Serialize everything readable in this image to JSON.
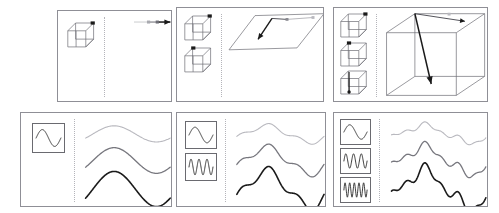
{
  "figure": {
    "background": "#ffffff",
    "width": 499,
    "height": 213,
    "panel_border_color": "#8f8f96",
    "divider_color": "#b4b4ba",
    "stroke_colors": [
      "#b9b9bf",
      "#77777e",
      "#1a1a1a"
    ],
    "rows": 2,
    "columns": 3
  },
  "panels": [
    {
      "id": "panel-1",
      "name": "one-cube-line",
      "row": 1,
      "column": 1,
      "left": 57,
      "top": 10,
      "width": 115,
      "height": 92,
      "left_label": "1 cube thumbnail",
      "right_label": "1D line with gradient arrow",
      "thumbnails": [
        {
          "kind": "cube",
          "marker": "top-right-dot",
          "left": 8,
          "top": 12,
          "width": 30,
          "height": 26
        }
      ],
      "divider_x": 46,
      "content_kind": "line-arrow",
      "arrow": {
        "description": "horizontal arrow, light-to-dark gradient, with waypoint dots",
        "waypoints": 3,
        "head": "right"
      }
    },
    {
      "id": "panel-2",
      "name": "two-cubes-plane",
      "row": 1,
      "column": 2,
      "left": 176,
      "top": 7,
      "width": 148,
      "height": 95,
      "left_label": "2 cube thumbnails",
      "right_label": "2D plane with polyline path",
      "thumbnails": [
        {
          "kind": "cube",
          "marker": "top-right-dot",
          "left": 6,
          "top": 8,
          "width": 30,
          "height": 26
        },
        {
          "kind": "cube",
          "marker": "top-left-dot",
          "left": 6,
          "top": 40,
          "width": 30,
          "height": 26
        }
      ],
      "divider_x": 44,
      "content_kind": "plane-path",
      "path": {
        "description": "parallelogram plane with kinked arrow path ending down-left",
        "vertices": 3,
        "head": "down-left"
      }
    },
    {
      "id": "panel-3",
      "name": "three-cubes-box",
      "row": 1,
      "column": 3,
      "left": 333,
      "top": 7,
      "width": 155,
      "height": 95,
      "left_label": "3 cube thumbnails",
      "right_label": "3D box with two arrows",
      "thumbnails": [
        {
          "kind": "cube",
          "marker": "top-right-dot",
          "left": 5,
          "top": 6,
          "width": 30,
          "height": 25
        },
        {
          "kind": "cube",
          "marker": "top-left-dot",
          "left": 5,
          "top": 35,
          "width": 30,
          "height": 25
        },
        {
          "kind": "cube",
          "marker": "vertical-line-dot",
          "left": 5,
          "top": 63,
          "width": 30,
          "height": 25
        }
      ],
      "divider_x": 42,
      "content_kind": "box-arrows",
      "arrows": [
        {
          "description": "short arrow to upper right",
          "head": "right"
        },
        {
          "description": "long arrow down into box interior",
          "head": "down"
        }
      ]
    },
    {
      "id": "panel-4",
      "name": "one-basis-curves",
      "row": 2,
      "column": 1,
      "left": 20,
      "top": 112,
      "width": 152,
      "height": 95,
      "left_label": "1 sine basis thumbnail",
      "right_label": "3 smooth curves of increasing amplitude",
      "thumbnails": [
        {
          "kind": "sine",
          "cycles": 1,
          "left": 11,
          "top": 10,
          "width": 33,
          "height": 30
        }
      ],
      "divider_x": 53,
      "content_kind": "curves",
      "curves": [
        {
          "index": 0,
          "cycles": 1,
          "amplitude": 0.3,
          "color": "#b9b9bf",
          "width": 1.1
        },
        {
          "index": 1,
          "cycles": 1,
          "amplitude": 0.62,
          "color": "#77777e",
          "width": 1.3
        },
        {
          "index": 2,
          "cycles": 1,
          "amplitude": 1.0,
          "color": "#1a1a1a",
          "width": 1.6
        }
      ]
    },
    {
      "id": "panel-5",
      "name": "two-basis-curves",
      "row": 2,
      "column": 2,
      "left": 176,
      "top": 112,
      "width": 150,
      "height": 95,
      "left_label": "2 sine basis thumbnails",
      "right_label": "3 curves with added mid-frequency detail",
      "thumbnails": [
        {
          "kind": "sine",
          "cycles": 1,
          "left": 8,
          "top": 8,
          "width": 32,
          "height": 28
        },
        {
          "kind": "sine",
          "cycles": 3,
          "left": 8,
          "top": 40,
          "width": 32,
          "height": 28
        }
      ],
      "divider_x": 48,
      "content_kind": "curves",
      "curves": [
        {
          "index": 0,
          "cycles": 2,
          "amplitude": 0.3,
          "color": "#b9b9bf",
          "width": 1.1
        },
        {
          "index": 1,
          "cycles": 2,
          "amplitude": 0.6,
          "color": "#77777e",
          "width": 1.3
        },
        {
          "index": 2,
          "cycles": 2,
          "amplitude": 1.0,
          "color": "#1a1a1a",
          "width": 1.6
        }
      ]
    },
    {
      "id": "panel-6",
      "name": "three-basis-curves",
      "row": 2,
      "column": 3,
      "left": 333,
      "top": 112,
      "width": 155,
      "height": 95,
      "left_label": "3 sine basis thumbnails",
      "right_label": "3 curves with high-frequency oscillation",
      "thumbnails": [
        {
          "kind": "sine",
          "cycles": 1,
          "left": 6,
          "top": 6,
          "width": 31,
          "height": 26
        },
        {
          "kind": "sine",
          "cycles": 3,
          "left": 6,
          "top": 35,
          "width": 31,
          "height": 26
        },
        {
          "kind": "sine",
          "cycles": 5,
          "left": 6,
          "top": 64,
          "width": 31,
          "height": 26
        }
      ],
      "divider_x": 45,
      "content_kind": "curves",
      "curves": [
        {
          "index": 0,
          "cycles": 3,
          "amplitude": 0.28,
          "color": "#b9b9bf",
          "width": 1.1
        },
        {
          "index": 1,
          "cycles": 3,
          "amplitude": 0.58,
          "color": "#77777e",
          "width": 1.3
        },
        {
          "index": 2,
          "cycles": 3,
          "amplitude": 1.0,
          "color": "#1a1a1a",
          "width": 1.6
        }
      ]
    }
  ]
}
